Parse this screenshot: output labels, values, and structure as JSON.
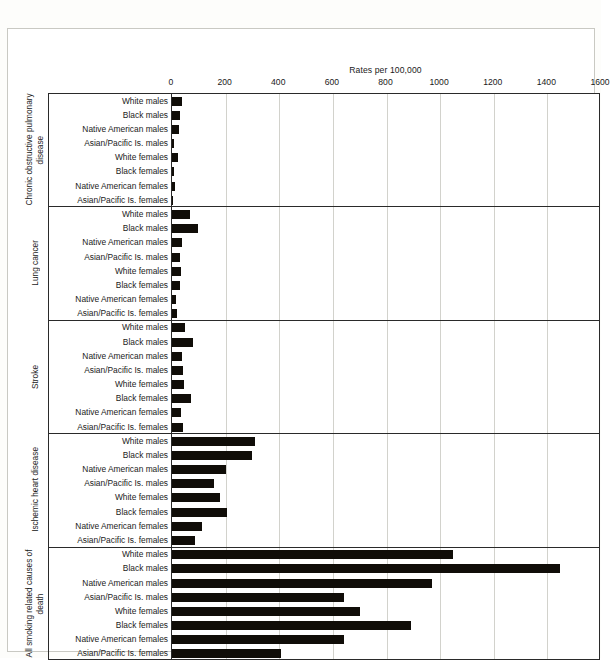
{
  "chart_data": {
    "type": "bar",
    "orientation": "horizontal",
    "title": "Rates per 100,000",
    "xlabel": "Rates per 100,000",
    "ylabel": "",
    "xlim": [
      0,
      1600
    ],
    "xticks": [
      0,
      200,
      400,
      600,
      800,
      1000,
      1200,
      1400,
      1600
    ],
    "grid": true,
    "legend": "none",
    "bar_color": "#100d08",
    "categories": [
      "White males",
      "Black males",
      "Native American males",
      "Asian/Pacific Is. males",
      "White females",
      "Black females",
      "Native American females",
      "Asian/Pacific Is. females"
    ],
    "groups": [
      {
        "name": "Chronic obstructive pulmonary disease",
        "values": [
          37,
          31,
          26,
          9,
          23,
          6,
          11,
          4
        ]
      },
      {
        "name": "Lung cancer",
        "values": [
          68,
          97,
          37,
          30,
          32,
          30,
          15,
          17
        ]
      },
      {
        "name": "Stroke",
        "values": [
          49,
          78,
          39,
          41,
          44,
          72,
          34,
          41
        ]
      },
      {
        "name": "Ischemic heart disease",
        "values": [
          310,
          298,
          202,
          155,
          178,
          206,
          113,
          86
        ]
      },
      {
        "name": "All smoking related causes of death",
        "values": [
          1048,
          1448,
          970,
          640,
          700,
          892,
          640,
          408
        ]
      }
    ]
  },
  "axis": {
    "title": "Rates per 100,000",
    "tick_labels": [
      "0",
      "200",
      "400",
      "600",
      "800",
      "1000",
      "1200",
      "1400",
      "1600"
    ]
  }
}
